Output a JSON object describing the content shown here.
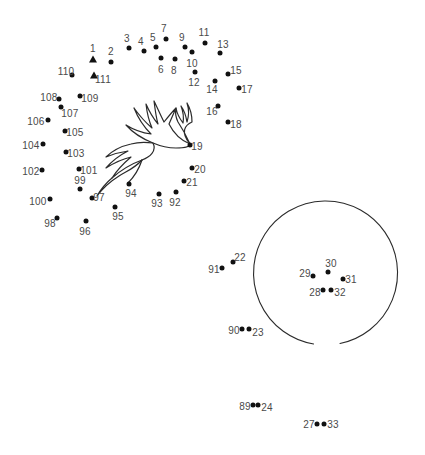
{
  "page": {
    "background_color": "#ffffff",
    "dot_color": "#111111",
    "label_color": "#4a4a4a",
    "line_color": "#2b2b2b",
    "width": 425,
    "height": 455
  },
  "shapes": {
    "circle": {
      "name": "open-circle-outline",
      "center_x": 325,
      "center_y": 272,
      "radius": 72,
      "gap_start_deg": 78,
      "gap_end_deg": 99
    },
    "leaves": {
      "name": "pineapple-crown-leaves"
    }
  },
  "dots": [
    {
      "n": "1",
      "x": 93,
      "y": 59,
      "marker": "triangle",
      "lx": 93,
      "ly": 48
    },
    {
      "n": "2",
      "x": 111,
      "y": 62,
      "marker": "dot",
      "lx": 111,
      "ly": 51
    },
    {
      "n": "3",
      "x": 129,
      "y": 48,
      "marker": "dot",
      "lx": 127,
      "ly": 38
    },
    {
      "n": "4",
      "x": 144,
      "y": 51,
      "marker": "dot",
      "lx": 141,
      "ly": 41
    },
    {
      "n": "5",
      "x": 156,
      "y": 47,
      "marker": "dot",
      "lx": 153,
      "ly": 37
    },
    {
      "n": "6",
      "x": 161,
      "y": 58,
      "marker": "dot",
      "lx": 161,
      "ly": 69
    },
    {
      "n": "7",
      "x": 166,
      "y": 39,
      "marker": "dot",
      "lx": 164,
      "ly": 28
    },
    {
      "n": "8",
      "x": 175,
      "y": 59,
      "marker": "dot",
      "lx": 174,
      "ly": 70
    },
    {
      "n": "9",
      "x": 185,
      "y": 47,
      "marker": "dot",
      "lx": 182,
      "ly": 37
    },
    {
      "n": "10",
      "x": 192,
      "y": 52,
      "marker": "dot",
      "lx": 192,
      "ly": 63
    },
    {
      "n": "11",
      "x": 205,
      "y": 43,
      "marker": "dot",
      "lx": 204,
      "ly": 32
    },
    {
      "n": "12",
      "x": 195,
      "y": 72,
      "marker": "dot",
      "lx": 194,
      "ly": 82
    },
    {
      "n": "13",
      "x": 220,
      "y": 53,
      "marker": "dot",
      "lx": 223,
      "ly": 44
    },
    {
      "n": "14",
      "x": 215,
      "y": 81,
      "marker": "dot",
      "lx": 212,
      "ly": 89
    },
    {
      "n": "15",
      "x": 228,
      "y": 74,
      "marker": "dot",
      "lx": 236,
      "ly": 70
    },
    {
      "n": "16",
      "x": 218,
      "y": 106,
      "marker": "dot",
      "lx": 212,
      "ly": 111
    },
    {
      "n": "17",
      "x": 239,
      "y": 88,
      "marker": "dot",
      "lx": 247,
      "ly": 89
    },
    {
      "n": "18",
      "x": 228,
      "y": 122,
      "marker": "dot",
      "lx": 236,
      "ly": 124
    },
    {
      "n": "19",
      "x": 190,
      "y": 145,
      "marker": "dot",
      "lx": 197,
      "ly": 146
    },
    {
      "n": "20",
      "x": 192,
      "y": 168,
      "marker": "dot",
      "lx": 200,
      "ly": 169
    },
    {
      "n": "21",
      "x": 184,
      "y": 181,
      "marker": "dot",
      "lx": 192,
      "ly": 182
    },
    {
      "n": "22",
      "x": 233,
      "y": 262,
      "marker": "dot",
      "lx": 240,
      "ly": 257
    },
    {
      "n": "23",
      "x": 249,
      "y": 329,
      "marker": "dot",
      "lx": 258,
      "ly": 332
    },
    {
      "n": "24",
      "x": 258,
      "y": 405,
      "marker": "dot",
      "lx": 267,
      "ly": 407
    },
    {
      "n": "27",
      "x": 317,
      "y": 424,
      "marker": "dot",
      "lx": 309,
      "ly": 424
    },
    {
      "n": "28",
      "x": 323,
      "y": 290,
      "marker": "dot",
      "lx": 315,
      "ly": 292
    },
    {
      "n": "29",
      "x": 313,
      "y": 276,
      "marker": "dot",
      "lx": 305,
      "ly": 273
    },
    {
      "n": "30",
      "x": 328,
      "y": 272,
      "marker": "dot",
      "lx": 331,
      "ly": 263
    },
    {
      "n": "31",
      "x": 343,
      "y": 279,
      "marker": "dot",
      "lx": 351,
      "ly": 279
    },
    {
      "n": "32",
      "x": 331,
      "y": 290,
      "marker": "dot",
      "lx": 340,
      "ly": 292
    },
    {
      "n": "33",
      "x": 324,
      "y": 424,
      "marker": "dot",
      "lx": 333,
      "ly": 424
    },
    {
      "n": "89",
      "x": 253,
      "y": 405,
      "marker": "dot",
      "lx": 245,
      "ly": 406
    },
    {
      "n": "90",
      "x": 242,
      "y": 329,
      "marker": "dot",
      "lx": 234,
      "ly": 330
    },
    {
      "n": "91",
      "x": 222,
      "y": 268,
      "marker": "dot",
      "lx": 214,
      "ly": 269
    },
    {
      "n": "92",
      "x": 176,
      "y": 192,
      "marker": "dot",
      "lx": 175,
      "ly": 202
    },
    {
      "n": "93",
      "x": 159,
      "y": 194,
      "marker": "dot",
      "lx": 157,
      "ly": 203
    },
    {
      "n": "94",
      "x": 129,
      "y": 184,
      "marker": "dot",
      "lx": 131,
      "ly": 193
    },
    {
      "n": "95",
      "x": 115,
      "y": 207,
      "marker": "dot",
      "lx": 118,
      "ly": 216
    },
    {
      "n": "96",
      "x": 86,
      "y": 221,
      "marker": "dot",
      "lx": 85,
      "ly": 231
    },
    {
      "n": "97",
      "x": 92,
      "y": 198,
      "marker": "dot",
      "lx": 99,
      "ly": 197
    },
    {
      "n": "98",
      "x": 57,
      "y": 218,
      "marker": "dot",
      "lx": 50,
      "ly": 223
    },
    {
      "n": "99",
      "x": 80,
      "y": 189,
      "marker": "dot",
      "lx": 80,
      "ly": 180
    },
    {
      "n": "100",
      "x": 50,
      "y": 199,
      "marker": "dot",
      "lx": 38,
      "ly": 201
    },
    {
      "n": "101",
      "x": 79,
      "y": 169,
      "marker": "dot",
      "lx": 89,
      "ly": 170
    },
    {
      "n": "102",
      "x": 42,
      "y": 170,
      "marker": "dot",
      "lx": 31,
      "ly": 171
    },
    {
      "n": "103",
      "x": 66,
      "y": 152,
      "marker": "dot",
      "lx": 76,
      "ly": 153
    },
    {
      "n": "104",
      "x": 43,
      "y": 144,
      "marker": "dot",
      "lx": 31,
      "ly": 145
    },
    {
      "n": "105",
      "x": 65,
      "y": 131,
      "marker": "dot",
      "lx": 75,
      "ly": 132
    },
    {
      "n": "106",
      "x": 48,
      "y": 120,
      "marker": "dot",
      "lx": 36,
      "ly": 121
    },
    {
      "n": "107",
      "x": 61,
      "y": 107,
      "marker": "dot",
      "lx": 70,
      "ly": 113
    },
    {
      "n": "108",
      "x": 59,
      "y": 99,
      "marker": "dot",
      "lx": 49,
      "ly": 97
    },
    {
      "n": "109",
      "x": 80,
      "y": 96,
      "marker": "dot",
      "lx": 90,
      "ly": 98
    },
    {
      "n": "110",
      "x": 72,
      "y": 75,
      "marker": "dot",
      "lx": 66,
      "ly": 71
    },
    {
      "n": "111",
      "x": 94,
      "y": 75,
      "marker": "triangle",
      "lx": 103,
      "ly": 79
    }
  ]
}
